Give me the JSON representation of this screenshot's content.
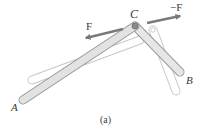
{
  "figure": {
    "caption": "(a)",
    "labels": {
      "A": "A",
      "B": "B",
      "C": "C",
      "F": "F",
      "negF": "−F"
    },
    "colors": {
      "bar_fill": "#e4e4e4",
      "bar_stroke": "#9a9a9a",
      "ghost_stroke": "#c8c8c8",
      "arrow": "#7a7a7a",
      "text": "#3a3a3a"
    }
  }
}
